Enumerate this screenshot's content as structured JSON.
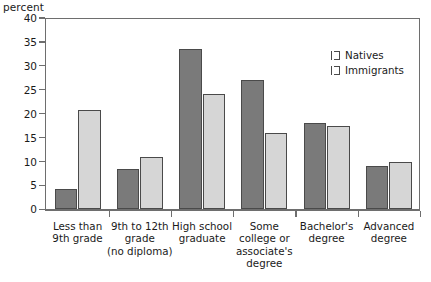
{
  "chart_data": {
    "type": "bar",
    "title": "",
    "subtitle": "",
    "xlabel": "",
    "ylabel": "percent",
    "ylim": [
      0,
      40
    ],
    "yticks": [
      0,
      5,
      10,
      15,
      20,
      25,
      30,
      35,
      40
    ],
    "grid": false,
    "legend_position": "top-right",
    "categories": [
      "Less than\n9th grade",
      "9th to 12th\ngrade\n(no diploma)",
      "High school\ngraduate",
      "Some\ncollege or\nassociate's\ndegree",
      "Bachelor's\ndegree",
      "Advanced\ndegree"
    ],
    "series": [
      {
        "name": "Natives",
        "color": "#7a7a7a",
        "values": [
          4.2,
          8.5,
          33.5,
          27.0,
          18.0,
          9.0
        ]
      },
      {
        "name": "Immigrants",
        "color": "#d6d6d6",
        "values": [
          20.8,
          11.0,
          24.2,
          16.0,
          17.5,
          9.9
        ]
      }
    ]
  },
  "legend": {
    "items": [
      {
        "label": "Natives",
        "color": "#7a7a7a"
      },
      {
        "label": "Immigrants",
        "color": "#d6d6d6"
      }
    ]
  },
  "axes": {
    "y_title": "percent"
  },
  "colors": {
    "natives": "#7a7a7a",
    "immigrants": "#d6d6d6",
    "axis": "#6e6e6e",
    "bar_border": "#4a4a4a",
    "text": "#1a1a1a",
    "background": "#ffffff"
  }
}
